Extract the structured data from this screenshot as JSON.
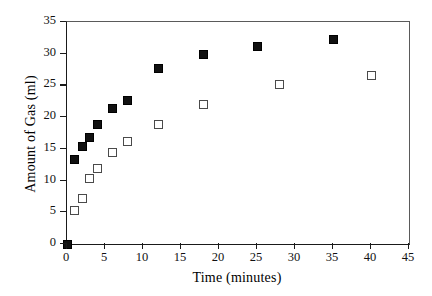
{
  "chart_data": {
    "type": "scatter",
    "title": "",
    "xlabel": "Time (minutes)",
    "ylabel": "Amount of Gas (ml)",
    "xlim": [
      0,
      45
    ],
    "ylim": [
      0,
      35
    ],
    "xticks": [
      0,
      5,
      10,
      15,
      20,
      25,
      30,
      35,
      40,
      45
    ],
    "yticks": [
      0,
      5,
      10,
      15,
      20,
      25,
      30,
      35
    ],
    "xtick_labels": [
      "0",
      "5",
      "10",
      "15",
      "20",
      "25",
      "30",
      "35",
      "40",
      "45"
    ],
    "ytick_labels": [
      "0",
      "5",
      "10",
      "15",
      "20",
      "25",
      "30",
      "35"
    ],
    "grid": false,
    "legend": "none",
    "series": [
      {
        "name": "filled-squares",
        "marker": "filled-square",
        "color": "#111111",
        "points": [
          {
            "x": 0,
            "y": 0
          },
          {
            "x": 1,
            "y": 13.3
          },
          {
            "x": 2,
            "y": 15.4
          },
          {
            "x": 3,
            "y": 16.8
          },
          {
            "x": 4,
            "y": 18.8
          },
          {
            "x": 6,
            "y": 21.4
          },
          {
            "x": 8,
            "y": 22.7
          },
          {
            "x": 12,
            "y": 27.6
          },
          {
            "x": 18,
            "y": 29.8
          },
          {
            "x": 25,
            "y": 31.1
          },
          {
            "x": 35,
            "y": 32.2
          }
        ]
      },
      {
        "name": "open-squares",
        "marker": "open-square",
        "color": "#4a4a4a",
        "points": [
          {
            "x": 1,
            "y": 5.3
          },
          {
            "x": 2,
            "y": 7.1
          },
          {
            "x": 3,
            "y": 10.3
          },
          {
            "x": 4,
            "y": 11.9
          },
          {
            "x": 6,
            "y": 14.5
          },
          {
            "x": 8,
            "y": 16.2
          },
          {
            "x": 12,
            "y": 18.9
          },
          {
            "x": 18,
            "y": 22.0
          },
          {
            "x": 28,
            "y": 25.1
          },
          {
            "x": 40,
            "y": 26.5
          }
        ]
      }
    ]
  }
}
